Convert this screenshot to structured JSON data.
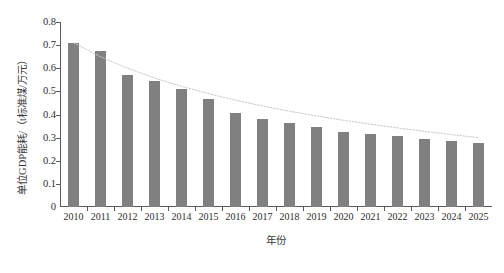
{
  "chart_data": {
    "type": "bar",
    "title": "",
    "subtitle": "",
    "xlabel": "年份",
    "ylabel": "单位GDP能耗/（t标准煤/万元）",
    "categories": [
      "2010",
      "2011",
      "2012",
      "2013",
      "2014",
      "2015",
      "2016",
      "2017",
      "2018",
      "2019",
      "2020",
      "2021",
      "2022",
      "2023",
      "2024",
      "2025"
    ],
    "values": [
      0.71,
      0.675,
      0.57,
      0.545,
      0.51,
      0.465,
      0.405,
      0.38,
      0.365,
      0.345,
      0.325,
      0.315,
      0.305,
      0.295,
      0.285,
      0.275
    ],
    "series": [
      {
        "name": "单位GDP能耗",
        "type": "bar",
        "values": [
          0.71,
          0.675,
          0.57,
          0.545,
          0.51,
          0.465,
          0.405,
          0.38,
          0.365,
          0.345,
          0.325,
          0.315,
          0.305,
          0.295,
          0.285,
          0.275
        ]
      },
      {
        "name": "趋势线",
        "type": "line",
        "style": "dotted",
        "values": [
          0.71,
          0.65,
          0.6,
          0.558,
          0.522,
          0.49,
          0.462,
          0.437,
          0.414,
          0.394,
          0.375,
          0.358,
          0.342,
          0.327,
          0.313,
          0.3
        ]
      }
    ],
    "ylim": [
      0,
      0.8
    ],
    "ytick_labels": [
      "0.8",
      "0.7",
      "0.6",
      "0.5",
      "0.4",
      "0.3",
      "0.2",
      "0.1",
      "0"
    ],
    "ytick_values": [
      0.8,
      0.7,
      0.6,
      0.5,
      0.4,
      0.3,
      0.2,
      0.1,
      0.0
    ],
    "grid": false,
    "legend": "none",
    "colors": {
      "bar": "#808080",
      "trendline": "#c9c9c9",
      "axis": "#5a5a5a",
      "text": "#2e2e2e",
      "background": "#ffffff"
    }
  }
}
